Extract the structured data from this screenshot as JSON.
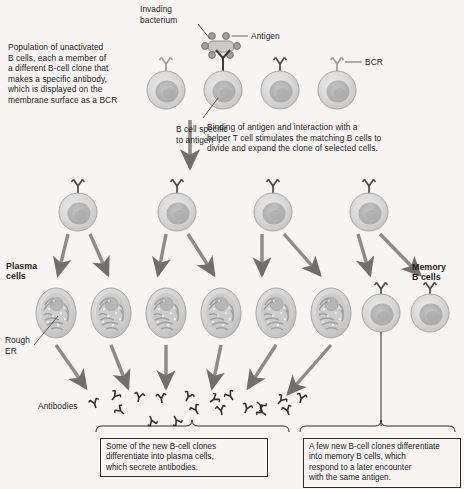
{
  "diagram": {
    "background_color": "#f6f5f3",
    "cell_fill": "#d9d9d9",
    "cell_edge": "#9a9a9a",
    "nucleus_fill": "#b4b4b4",
    "arrow_color": "#6f6f6f",
    "ink_color": "#1d1d1d"
  },
  "labels": {
    "population": "Population of unactivated\nB cells, each a member of\na different B-cell clone that\nmakes a specific antibody,\nwhich is displayed on the\nmembrane surface as a BCR",
    "invading_bacterium": "Invading\nbacterium",
    "antigen": "Antigen",
    "bcr": "BCR",
    "b_cell_specific": "B cell specific\nto antigen",
    "binding_note": "Binding of antigen and interaction with a\nhelper T cell stimulates the matching B cells to\ndivide and expand the clone of selected cells.",
    "plasma_cells": "Plasma\ncells",
    "memory_b_cells": "Memory\nB cells",
    "rough_er": "Rough\nER",
    "antibodies": "Antibodies",
    "plasma_box": "Some of the new B-cell clones\ndifferentiate into plasma cells,\nwhich secrete antibodies.",
    "memory_box": "A few new B-cell clones differentiate\ninto memory B cells, which\nrespond to a later encounter\nwith the same antigen."
  },
  "rows": {
    "unactivated_b_cells": {
      "count": 4,
      "y": 90,
      "radius": 19,
      "x_positions": [
        166,
        223,
        280,
        337
      ],
      "selected_index": 1
    },
    "activated_clone": {
      "count": 4,
      "y": 212,
      "radius": 19,
      "x_positions": [
        78,
        177,
        273,
        369
      ]
    },
    "plasma_cells": {
      "count": 6,
      "y": 313,
      "rx": 20,
      "ry": 25,
      "x_positions": [
        56,
        111,
        166,
        221,
        276,
        331
      ]
    },
    "memory_cells": {
      "count": 2,
      "y": 313,
      "radius": 18,
      "x_positions": [
        381,
        430
      ]
    },
    "antibodies": {
      "count": 18,
      "label_x": 38,
      "label_y": 405
    }
  }
}
